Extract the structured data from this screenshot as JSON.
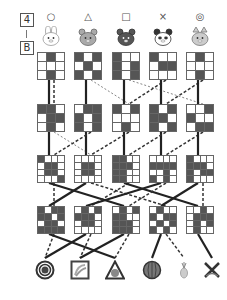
{
  "header": {
    "number": "4",
    "separator": "|",
    "letter": "B"
  },
  "columns": [
    {
      "symbol": "○",
      "animal": "rabbit-icon"
    },
    {
      "symbol": "△",
      "animal": "bear-icon"
    },
    {
      "symbol": "□",
      "animal": "dark-bear-icon"
    },
    {
      "symbol": "×",
      "animal": "panda-icon"
    },
    {
      "symbol": "◎",
      "animal": "cat-icon"
    }
  ],
  "rows": [
    {
      "size": 3,
      "grids": [
        [
          [
            0,
            1,
            0
          ],
          [
            0,
            0,
            0
          ],
          [
            0,
            1,
            0
          ]
        ],
        [
          [
            1,
            0,
            1
          ],
          [
            0,
            1,
            0
          ],
          [
            1,
            0,
            1
          ]
        ],
        [
          [
            1,
            0,
            0
          ],
          [
            1,
            0,
            1
          ],
          [
            1,
            0,
            1
          ]
        ],
        [
          [
            1,
            0,
            0
          ],
          [
            0,
            1,
            1
          ],
          [
            0,
            0,
            0
          ]
        ],
        [
          [
            0,
            1,
            0
          ],
          [
            0,
            0,
            0
          ],
          [
            0,
            1,
            0
          ]
        ]
      ]
    },
    {
      "size": 3,
      "grids": [
        [
          [
            1,
            1,
            0
          ],
          [
            0,
            1,
            1
          ],
          [
            0,
            1,
            0
          ]
        ],
        [
          [
            0,
            1,
            1
          ],
          [
            1,
            0,
            1
          ],
          [
            1,
            0,
            1
          ]
        ],
        [
          [
            1,
            0,
            1
          ],
          [
            0,
            0,
            0
          ],
          [
            0,
            1,
            0
          ]
        ],
        [
          [
            1,
            0,
            1
          ],
          [
            1,
            1,
            0
          ],
          [
            1,
            0,
            1
          ]
        ],
        [
          [
            0,
            0,
            1
          ],
          [
            1,
            0,
            0
          ],
          [
            0,
            1,
            1
          ]
        ]
      ]
    },
    {
      "size": 4,
      "grids": [
        [
          [
            1,
            0,
            0,
            0
          ],
          [
            0,
            1,
            1,
            0
          ],
          [
            0,
            1,
            1,
            0
          ],
          [
            0,
            0,
            0,
            1
          ]
        ],
        [
          [
            0,
            0,
            0,
            0
          ],
          [
            0,
            1,
            1,
            0
          ],
          [
            0,
            1,
            1,
            0
          ],
          [
            0,
            0,
            0,
            0
          ]
        ],
        [
          [
            1,
            1,
            0,
            0
          ],
          [
            1,
            1,
            1,
            0
          ],
          [
            1,
            1,
            0,
            0
          ],
          [
            1,
            1,
            0,
            0
          ]
        ],
        [
          [
            0,
            0,
            0,
            0
          ],
          [
            1,
            1,
            1,
            1
          ],
          [
            0,
            0,
            1,
            0
          ],
          [
            1,
            0,
            1,
            0
          ]
        ],
        [
          [
            1,
            0,
            0,
            0
          ],
          [
            1,
            1,
            1,
            0
          ],
          [
            1,
            0,
            1,
            1
          ],
          [
            1,
            0,
            0,
            0
          ]
        ]
      ]
    },
    {
      "size": 4,
      "grids": [
        [
          [
            1,
            0,
            1,
            1
          ],
          [
            1,
            1,
            0,
            1
          ],
          [
            0,
            1,
            1,
            0
          ],
          [
            1,
            1,
            1,
            1
          ]
        ],
        [
          [
            0,
            1,
            0,
            1
          ],
          [
            1,
            1,
            1,
            0
          ],
          [
            0,
            1,
            1,
            0
          ],
          [
            0,
            0,
            0,
            0
          ]
        ],
        [
          [
            0,
            1,
            0,
            1
          ],
          [
            1,
            1,
            0,
            0
          ],
          [
            1,
            1,
            1,
            0
          ],
          [
            1,
            1,
            1,
            0
          ]
        ],
        [
          [
            0,
            1,
            0,
            0
          ],
          [
            1,
            0,
            1,
            1
          ],
          [
            0,
            1,
            0,
            1
          ],
          [
            1,
            0,
            1,
            0
          ]
        ],
        [
          [
            0,
            0,
            1,
            0
          ],
          [
            0,
            1,
            1,
            1
          ],
          [
            0,
            1,
            0,
            1
          ],
          [
            0,
            1,
            0,
            0
          ]
        ]
      ]
    }
  ],
  "bottom_items": [
    {
      "name": "double-circle-target-icon"
    },
    {
      "name": "square-bananas-icon"
    },
    {
      "name": "triangle-fruit-icon"
    },
    {
      "name": "circle-watermelon-icon"
    },
    {
      "name": "pineapple-icon"
    },
    {
      "name": "cross-bananas-icon"
    }
  ],
  "connections": [
    {
      "from_row": 0,
      "from": 0,
      "to": 0,
      "style": "solid"
    },
    {
      "from_row": 0,
      "from": 0,
      "to": 0,
      "style": "dashed"
    },
    {
      "from_row": 0,
      "from": 1,
      "to": 1,
      "style": "solid"
    },
    {
      "from_row": 0,
      "from": 1,
      "to": 2,
      "style": "dotted"
    },
    {
      "from_row": 0,
      "from": 2,
      "to": 2,
      "style": "solid"
    },
    {
      "from_row": 0,
      "from": 2,
      "to": 4,
      "style": "dotted"
    },
    {
      "from_row": 0,
      "from": 3,
      "to": 2,
      "style": "dashed"
    },
    {
      "from_row": 0,
      "from": 3,
      "to": 3,
      "style": "solid"
    },
    {
      "from_row": 0,
      "from": 4,
      "to": 3,
      "style": "dashed"
    },
    {
      "from_row": 0,
      "from": 4,
      "to": 4,
      "style": "solid"
    },
    {
      "from_row": 1,
      "from": 0,
      "to": 0,
      "style": "solid"
    },
    {
      "from_row": 1,
      "from": 0,
      "to": 1,
      "style": "dotted"
    },
    {
      "from_row": 1,
      "from": 1,
      "to": 1,
      "style": "solid"
    },
    {
      "from_row": 1,
      "from": 1,
      "to": 0,
      "style": "dashed"
    },
    {
      "from_row": 1,
      "from": 2,
      "to": 1,
      "style": "dashed"
    },
    {
      "from_row": 1,
      "from": 2,
      "to": 2,
      "style": "solid"
    },
    {
      "from_row": 1,
      "from": 3,
      "to": 3,
      "style": "solid"
    },
    {
      "from_row": 1,
      "from": 3,
      "to": 2,
      "style": "dashed"
    },
    {
      "from_row": 1,
      "from": 4,
      "to": 3,
      "style": "dashed"
    },
    {
      "from_row": 1,
      "from": 4,
      "to": 4,
      "style": "solid"
    },
    {
      "from_row": 2,
      "from": 0,
      "to": 0,
      "style": "dashed"
    },
    {
      "from_row": 2,
      "from": 0,
      "to": 2,
      "style": "solid"
    },
    {
      "from_row": 2,
      "from": 1,
      "to": 0,
      "style": "solid"
    },
    {
      "from_row": 2,
      "from": 1,
      "to": 3,
      "style": "dashed"
    },
    {
      "from_row": 2,
      "from": 2,
      "to": 1,
      "style": "dashed"
    },
    {
      "from_row": 2,
      "from": 2,
      "to": 4,
      "style": "solid"
    },
    {
      "from_row": 2,
      "from": 3,
      "to": 2,
      "style": "dashed"
    },
    {
      "from_row": 2,
      "from": 3,
      "to": 1,
      "style": "solid"
    },
    {
      "from_row": 2,
      "from": 4,
      "to": 4,
      "style": "dashed"
    },
    {
      "from_row": 2,
      "from": 4,
      "to": 3,
      "style": "solid"
    },
    {
      "from_row": 3,
      "from": 0,
      "to": 0,
      "style": "dashed"
    },
    {
      "from_row": 3,
      "from": 0,
      "to": 2,
      "style": "solid"
    },
    {
      "from_row": 3,
      "from": 1,
      "to": 1,
      "style": "dashed"
    },
    {
      "from_row": 3,
      "from": 1,
      "to": 0,
      "style": "solid"
    },
    {
      "from_row": 3,
      "from": 2,
      "to": 2,
      "style": "dashed"
    },
    {
      "from_row": 3,
      "from": 2,
      "to": 1,
      "style": "solid"
    },
    {
      "from_row": 3,
      "from": 3,
      "to": 3,
      "style": "solid"
    },
    {
      "from_row": 3,
      "from": 3,
      "to": 4,
      "style": "dashed"
    },
    {
      "from_row": 3,
      "from": 4,
      "to": 5,
      "style": "solid"
    }
  ]
}
